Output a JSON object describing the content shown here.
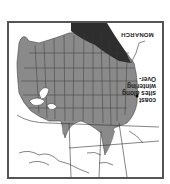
{
  "map": {
    "title": "MONARCH",
    "annotation": {
      "line1": "Over-",
      "line2": "wintering",
      "line3": "sites along",
      "line4": "coast"
    },
    "orientation": "rotated 180 degrees",
    "legend_colors": {
      "summer_range": "#8a8a8a",
      "dense_region": "#2e2e2e",
      "land": "#ffffff",
      "borders": "#333333",
      "frame": "#555555"
    }
  }
}
